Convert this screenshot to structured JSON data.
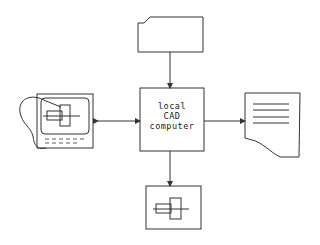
{
  "diagram": {
    "central_node": {
      "lines": [
        "local",
        "CAD",
        "computer"
      ]
    },
    "nodes": [
      {
        "id": "input-card",
        "shape": "punched-card"
      },
      {
        "id": "graphics-terminal",
        "shape": "monitor-with-keyboard-and-light-pen"
      },
      {
        "id": "printout",
        "shape": "document"
      },
      {
        "id": "plotter-display",
        "shape": "box-with-part-drawing"
      }
    ],
    "edges": [
      {
        "from": "input-card",
        "to": "central_node",
        "direction": "one-way"
      },
      {
        "from": "graphics-terminal",
        "to": "central_node",
        "direction": "two-way"
      },
      {
        "from": "central_node",
        "to": "printout",
        "direction": "one-way"
      },
      {
        "from": "central_node",
        "to": "plotter-display",
        "direction": "one-way"
      }
    ],
    "colors": {
      "stroke": "#333333",
      "background": "#ffffff"
    }
  }
}
